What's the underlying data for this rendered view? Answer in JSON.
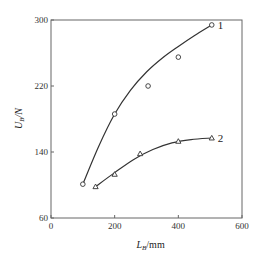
{
  "chart_data": {
    "type": "line",
    "title": "",
    "xlabel": "L_B/mm",
    "ylabel": "U_B/N",
    "xlabel_main": "L",
    "xlabel_sub": "B",
    "xlabel_unit": "/mm",
    "ylabel_main": "U",
    "ylabel_sub": "B",
    "ylabel_unit": "/N",
    "xlim": [
      0,
      600
    ],
    "ylim": [
      60,
      300
    ],
    "xticks": [
      0,
      200,
      400,
      600
    ],
    "yticks": [
      60,
      140,
      220,
      300
    ],
    "grid": false,
    "legend": "inline curve labels",
    "series": [
      {
        "name": "1",
        "marker": "circle",
        "points": [
          [
            100,
            101
          ],
          [
            200,
            186
          ],
          [
            305,
            220
          ],
          [
            400,
            255
          ],
          [
            505,
            294
          ]
        ],
        "fit": [
          [
            100,
            101
          ],
          [
            150,
            147
          ],
          [
            200,
            186
          ],
          [
            250,
            215
          ],
          [
            300,
            237
          ],
          [
            350,
            254
          ],
          [
            400,
            268
          ],
          [
            450,
            281
          ],
          [
            505,
            294
          ]
        ]
      },
      {
        "name": "2",
        "marker": "triangle",
        "points": [
          [
            140,
            98
          ],
          [
            200,
            113
          ],
          [
            280,
            138
          ],
          [
            400,
            153
          ],
          [
            505,
            157
          ]
        ],
        "fit": [
          [
            140,
            98
          ],
          [
            200,
            115
          ],
          [
            260,
            131
          ],
          [
            320,
            143
          ],
          [
            380,
            151
          ],
          [
            440,
            155
          ],
          [
            505,
            157
          ]
        ]
      }
    ]
  }
}
